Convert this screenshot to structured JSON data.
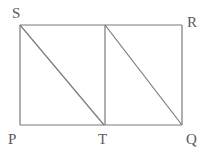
{
  "diagram": {
    "points": {
      "S": "S",
      "R": "R",
      "P": "P",
      "T": "T",
      "Q": "Q"
    },
    "segments": [
      "SR",
      "RQ",
      "QP",
      "PS",
      "T-top",
      "ST",
      "top-Q"
    ],
    "line_color": "#7a7a7a",
    "label_color": "#5a5a5a"
  }
}
